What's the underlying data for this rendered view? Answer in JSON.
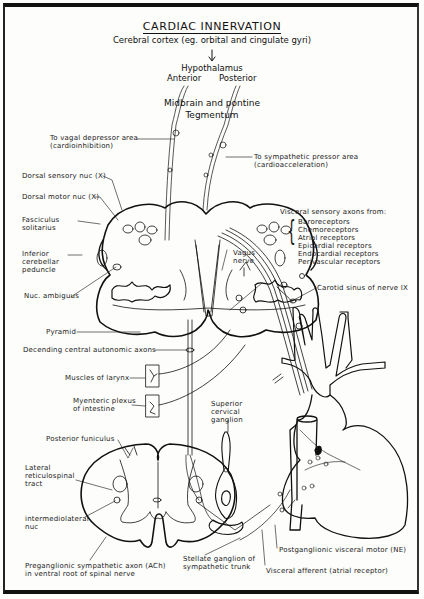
{
  "title": "CARDIAC INNERVATION",
  "hierarchy": {
    "cortex": "Cerebral cortex (eg. orbital and cingulate gyri)",
    "hypothalamus": "Hypothalamus",
    "anterior": "Anterior",
    "posterior": "Posterior",
    "midbrain": "Midbrain and pontine",
    "tegmentum": "Tegmentum"
  },
  "labels": {
    "vagal_depressor": "To vagal depressor area",
    "vagal_depressor_sub": "(cardioinhibition)",
    "sympathetic_pressor": "To sympathetic pressor area",
    "sympathetic_pressor_sub": "(cardioacceleration)",
    "dorsal_sensory": "Dorsal sensory nuc (X)",
    "dorsal_motor": "Dorsal motor nuc (X)",
    "fasciculus_1": "Fasciculus",
    "fasciculus_2": "solitarius",
    "inferior_1": "Inferior",
    "inferior_2": "cerebellar",
    "inferior_3": "peduncle",
    "nuc_ambiguus": "Nuc. ambiguus",
    "pyramid": "Pyramid",
    "descending": "Decending central autonomic axons",
    "larynx": "Muscles of larynx",
    "myenteric_1": "Myenteric plexus",
    "myenteric_2": "of intestine",
    "vagus_1": "Vagus",
    "vagus_2": "nerve",
    "visceral_header": "Visceral sensory axons from:",
    "receptors": [
      "Baroreceptors",
      "Chemoreceptors",
      "Atrial receptors",
      "Epicardial receptors",
      "Endocardial receptors",
      "Perivascular receptors"
    ],
    "carotid": "Carotid sinus of nerve IX",
    "superior_1": "Superior",
    "superior_2": "cervical",
    "superior_3": "ganglion",
    "posterior_funiculus": "Posterior funiculus",
    "lateral_1": "Lateral",
    "lateral_2": "reticulospinal",
    "lateral_3": "tract",
    "intermedio_1": "intermediolateral",
    "intermedio_2": "nuc",
    "preganglionic_1": "Preganglionic sympathetic axon (ACh)",
    "preganglionic_2": "in ventral root of spinal nerve",
    "stellate_1": "Stellate ganglion of",
    "stellate_2": "sympathetic trunk",
    "postganglionic": "Postganglionic visceral motor (NE)",
    "visceral_afferent": "Visceral afferent (atrial receptor)"
  }
}
